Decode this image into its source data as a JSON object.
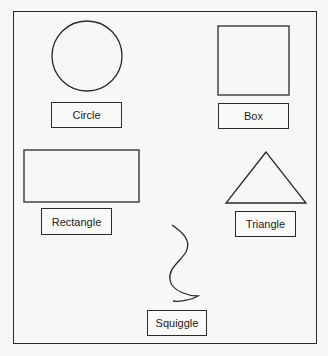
{
  "diagram": {
    "stroke_color": "#2a2a2a",
    "background_color": "#f7f7f5",
    "shapes": [
      {
        "id": "circle",
        "type": "circle",
        "label": "Circle"
      },
      {
        "id": "box",
        "type": "square",
        "label": "Box"
      },
      {
        "id": "rectangle",
        "type": "rectangle",
        "label": "Rectangle"
      },
      {
        "id": "triangle",
        "type": "triangle",
        "label": "Triangle"
      },
      {
        "id": "squiggle",
        "type": "curve",
        "label": "Squiggle"
      }
    ]
  }
}
